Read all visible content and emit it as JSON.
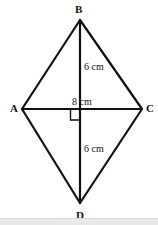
{
  "figure": {
    "shape": "kite",
    "background_color": "#ffffff",
    "stroke_color": "#111111",
    "stroke_width": 2,
    "vertices": [
      {
        "name": "B",
        "label": "B",
        "role": "top-vertex",
        "x": 80,
        "y": 20,
        "label_x": 75,
        "label_y": 4
      },
      {
        "name": "A",
        "label": "A",
        "role": "left-vertex",
        "x": 22,
        "y": 109,
        "label_x": 10,
        "label_y": 103
      },
      {
        "name": "C",
        "label": "C",
        "role": "right-vertex",
        "x": 142,
        "y": 109,
        "label_x": 146,
        "label_y": 103
      },
      {
        "name": "D",
        "label": "D",
        "role": "bottom-vertex",
        "x": 80,
        "y": 203,
        "label_x": 76,
        "label_y": 210
      }
    ],
    "edges": [
      {
        "from": "A",
        "to": "B"
      },
      {
        "from": "B",
        "to": "C"
      },
      {
        "from": "C",
        "to": "D"
      },
      {
        "from": "D",
        "to": "A"
      }
    ],
    "diagonals": [
      {
        "name": "vertical-diagonal",
        "from": "B",
        "to": "D"
      },
      {
        "name": "horizontal-diagonal",
        "from": "A",
        "to": "C"
      }
    ],
    "intersection": {
      "x": 80,
      "y": 109
    },
    "right_angle_marker": {
      "present": true,
      "x": 71,
      "y": 110,
      "size": 10,
      "position": "lower-left-of-intersection"
    },
    "measurements": [
      {
        "name": "top-segment",
        "text": "6 cm",
        "segment": "B to center",
        "x": 84,
        "y": 62
      },
      {
        "name": "horizontal-segment",
        "text": "8 cm",
        "segment": "A to C",
        "x": 72,
        "y": 97
      },
      {
        "name": "bottom-segment",
        "text": "6 cm",
        "segment": "center to D",
        "x": 84,
        "y": 144
      }
    ]
  },
  "bottom_strip": {
    "present": true,
    "color": "#e9e9e9"
  }
}
